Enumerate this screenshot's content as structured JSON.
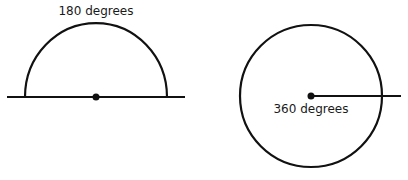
{
  "diagram": {
    "left": {
      "shape": "semicircle",
      "label": "180 degrees"
    },
    "right": {
      "shape": "circle",
      "label": "360 degrees"
    },
    "colors": {
      "stroke": "#111111",
      "background": "#ffffff"
    }
  }
}
